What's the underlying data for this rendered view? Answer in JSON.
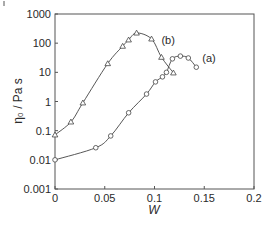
{
  "chart_data": {
    "type": "line",
    "title": "",
    "xlabel": "W",
    "ylabel": "η₀ / Pa s",
    "xlim": [
      0,
      0.2
    ],
    "ylim": [
      0.001,
      1000
    ],
    "yscale": "log",
    "xticks": [
      0,
      0.05,
      0.1,
      0.15,
      0.2
    ],
    "xtick_labels": [
      "0",
      "0.05",
      "0.1",
      "0.15",
      "0.2"
    ],
    "yticks": [
      0.001,
      0.01,
      0.1,
      1,
      10,
      100,
      1000
    ],
    "ytick_labels": [
      "0.001",
      "0.01",
      "0.1",
      "1",
      "10",
      "100",
      "1000"
    ],
    "grid": false,
    "legend": "none (inline series labels)",
    "series": [
      {
        "name": "(a)",
        "marker": "circle",
        "x": [
          0,
          0.041,
          0.056,
          0.074,
          0.092,
          0.101,
          0.108,
          0.112,
          0.118,
          0.126,
          0.134,
          0.142
        ],
        "y": [
          0.01,
          0.026,
          0.066,
          0.41,
          1.8,
          4.7,
          7,
          10,
          29,
          36,
          31,
          15
        ],
        "label_pos": [
          0.148,
          30
        ]
      },
      {
        "name": "(b)",
        "marker": "triangle",
        "x": [
          0,
          0.016,
          0.028,
          0.053,
          0.068,
          0.074,
          0.082,
          0.097,
          0.107,
          0.119
        ],
        "y": [
          0.072,
          0.2,
          0.9,
          20,
          79,
          130,
          224,
          140,
          33,
          9.6
        ],
        "label_pos": [
          0.107,
          130
        ]
      }
    ]
  }
}
